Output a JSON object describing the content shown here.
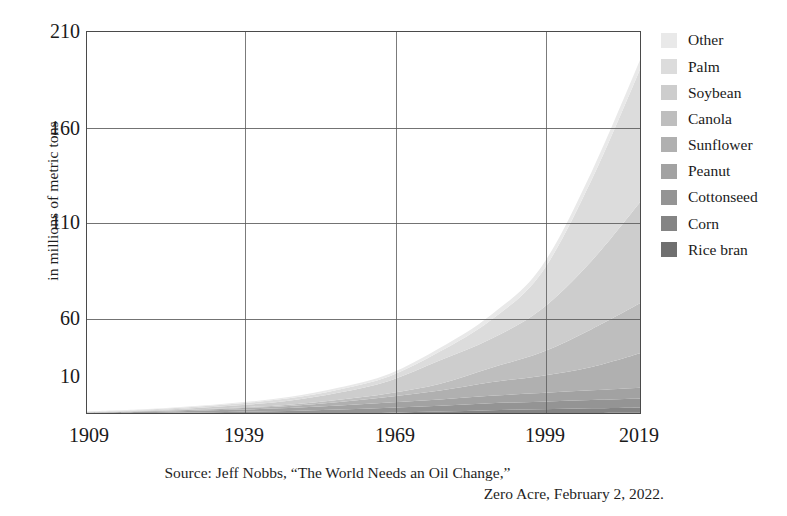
{
  "axes": {
    "ylabel": "in millions of metric tons",
    "yticks": [
      "210",
      "160",
      "110",
      "60",
      "10"
    ],
    "xticks": [
      "1909",
      "1939",
      "1969",
      "1999",
      "2019"
    ]
  },
  "legend": {
    "items": [
      {
        "label": "Other",
        "color": "#e9e9e9"
      },
      {
        "label": "Palm",
        "color": "#dcdcdc"
      },
      {
        "label": "Soybean",
        "color": "#cdcdcd"
      },
      {
        "label": "Canola",
        "color": "#bebebe"
      },
      {
        "label": "Sunflower",
        "color": "#b0b0b0"
      },
      {
        "label": "Peanut",
        "color": "#a2a2a2"
      },
      {
        "label": "Cottonseed",
        "color": "#949494"
      },
      {
        "label": "Corn",
        "color": "#848484"
      },
      {
        "label": "Rice bran",
        "color": "#6f6f6f"
      }
    ]
  },
  "caption": {
    "line1": "Source: Jeff Nobbs, “The World Needs an Oil Change,”",
    "line2": "Zero Acre, February 2, 2022."
  },
  "chart_data": {
    "type": "area",
    "stacked": true,
    "title": "",
    "xlabel": "",
    "ylabel": "in millions of metric tons",
    "xlim": [
      1909,
      2019
    ],
    "ylim": [
      0,
      213
    ],
    "grid": true,
    "legend_position": "right",
    "x": [
      1909,
      1919,
      1929,
      1939,
      1949,
      1959,
      1969,
      1979,
      1989,
      1999,
      2009,
      2019
    ],
    "series": [
      {
        "name": "Rice bran",
        "color": "#6f6f6f",
        "values": [
          0.1,
          0.12,
          0.15,
          0.2,
          0.25,
          0.35,
          0.5,
          0.7,
          0.9,
          1.0,
          1.1,
          1.2
        ]
      },
      {
        "name": "Corn",
        "color": "#848484",
        "values": [
          0.05,
          0.08,
          0.12,
          0.2,
          0.3,
          0.5,
          0.8,
          1.2,
          1.8,
          2.2,
          2.6,
          3.0
        ]
      },
      {
        "name": "Cottonseed",
        "color": "#949494",
        "values": [
          0.6,
          0.8,
          1.1,
          1.4,
          1.7,
          2.2,
          2.7,
          3.2,
          3.8,
          4.2,
          4.6,
          5.0
        ]
      },
      {
        "name": "Peanut",
        "color": "#a2a2a2",
        "values": [
          0.4,
          0.6,
          0.9,
          1.2,
          1.6,
          2.2,
          2.9,
          3.5,
          4.2,
          4.8,
          5.4,
          6.0
        ]
      },
      {
        "name": "Sunflower",
        "color": "#b0b0b0",
        "values": [
          0.2,
          0.3,
          0.5,
          0.8,
          1.2,
          2.0,
          3.2,
          5.0,
          7.5,
          9.5,
          13.0,
          19.5
        ]
      },
      {
        "name": "Canola",
        "color": "#bebebe",
        "values": [
          0.1,
          0.15,
          0.25,
          0.4,
          0.7,
          1.2,
          2.0,
          3.8,
          8.0,
          13.0,
          21.0,
          28.0
        ]
      },
      {
        "name": "Soybean",
        "color": "#cdcdcd",
        "values": [
          0.15,
          0.3,
          0.6,
          1.2,
          2.2,
          4.0,
          7.0,
          13.0,
          16.0,
          24.0,
          38.0,
          57.0
        ]
      },
      {
        "name": "Palm",
        "color": "#dcdcdc",
        "values": [
          0.2,
          0.4,
          0.7,
          1.0,
          1.3,
          1.8,
          2.5,
          5.0,
          10.5,
          20.0,
          45.0,
          75.0
        ]
      },
      {
        "name": "Other",
        "color": "#e9e9e9",
        "values": [
          0.2,
          0.25,
          0.35,
          0.5,
          0.7,
          1.0,
          1.4,
          2.0,
          2.8,
          3.5,
          4.5,
          5.3
        ]
      }
    ],
    "totals": [
      2.0,
      2.9,
      4.67,
      6.9,
      9.95,
      15.25,
      23.0,
      37.4,
      55.5,
      82.2,
      135.2,
      200.0
    ]
  }
}
